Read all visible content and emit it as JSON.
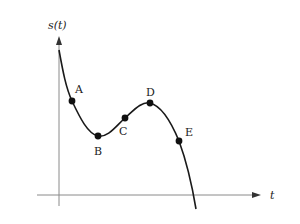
{
  "diagram": {
    "axes": {
      "y_label": "s(t)",
      "x_label": "t"
    },
    "points": [
      {
        "label": "A",
        "x": 72,
        "y": 101,
        "lx": 75,
        "ly": 93
      },
      {
        "label": "B",
        "x": 98,
        "y": 136,
        "lx": 94,
        "ly": 154
      },
      {
        "label": "C",
        "x": 125,
        "y": 118,
        "lx": 119,
        "ly": 135
      },
      {
        "label": "D",
        "x": 150,
        "y": 103,
        "lx": 146,
        "ly": 96
      },
      {
        "label": "E",
        "x": 179,
        "y": 141,
        "lx": 185,
        "ly": 137
      }
    ],
    "colors": {
      "axis": "#8a8a8a",
      "curve": "#1a1a1a",
      "point": "#111111"
    }
  }
}
